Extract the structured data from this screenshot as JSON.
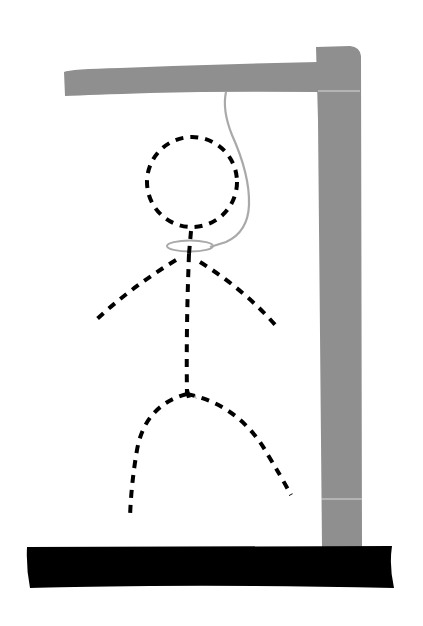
{
  "illustration": {
    "title": "Hangman drawing",
    "colors": {
      "background": "#ffffff",
      "gallows": "#8f8f8f",
      "gallows_seam": "#d9d9d9",
      "rope": "#a9a9a9",
      "base": "#000000",
      "figure": "#000000"
    },
    "parts": {
      "beam": "gallows-beam",
      "post": "gallows-post",
      "base": "gallows-base",
      "rope": "rope",
      "noose": "noose",
      "head": "figure-head",
      "body": "figure-body",
      "left_arm": "figure-left-arm",
      "right_arm": "figure-right-arm",
      "left_leg": "figure-left-leg",
      "right_leg": "figure-right-leg"
    },
    "figure_style": "dashed"
  }
}
